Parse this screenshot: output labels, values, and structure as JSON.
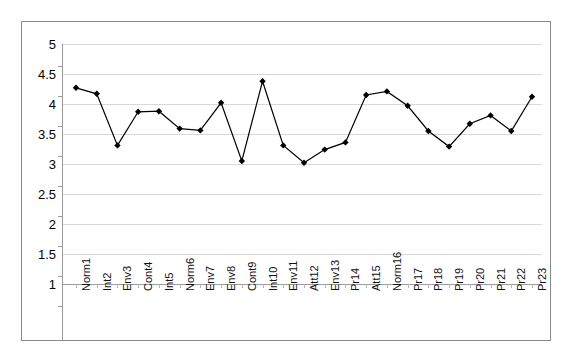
{
  "chart_data": {
    "type": "line",
    "title": "",
    "subtitle": "",
    "xlabel": "",
    "ylabel": "",
    "ylim": [
      1,
      5
    ],
    "y_ticks": [
      "1",
      "1.5",
      "2",
      "2.5",
      "3",
      "3.5",
      "4",
      "4.5",
      "5"
    ],
    "y_tick_values": [
      1,
      1.5,
      2,
      2.5,
      3,
      3.5,
      4,
      4.5,
      5
    ],
    "grid": true,
    "legend": "none",
    "marker": "diamond",
    "marker_color": "#000000",
    "line_color": "#000000",
    "categories": [
      "Norm1",
      "Int2",
      "Env3",
      "Cont4",
      "Int5",
      "Norm6",
      "Env7",
      "Env8",
      "Cont9",
      "Int10",
      "Env11",
      "Att12",
      "Env13",
      "Pr14",
      "Att15",
      "Norm16",
      "Pr17",
      "Pr18",
      "Pr19",
      "Pr20",
      "Pr21",
      "Pr22",
      "Pr23"
    ],
    "values": [
      4.27,
      4.17,
      3.31,
      3.87,
      3.88,
      3.59,
      3.56,
      4.02,
      3.05,
      4.38,
      3.31,
      3.02,
      3.24,
      3.36,
      4.15,
      4.21,
      3.97,
      3.55,
      3.29,
      3.67,
      3.81,
      3.55,
      4.12
    ],
    "series": [
      {
        "name": "Series 1",
        "values": [
          4.27,
          4.17,
          3.31,
          3.87,
          3.88,
          3.59,
          3.56,
          4.02,
          3.05,
          4.38,
          3.31,
          3.02,
          3.24,
          3.36,
          4.15,
          4.21,
          3.97,
          3.55,
          3.29,
          3.67,
          3.81,
          3.55,
          4.12
        ]
      }
    ]
  }
}
